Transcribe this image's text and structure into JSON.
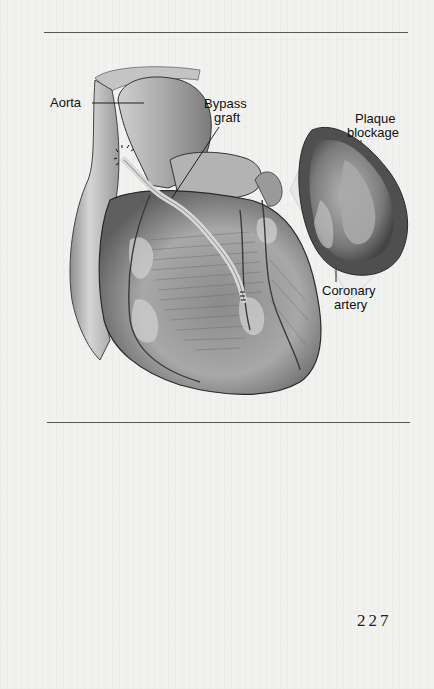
{
  "figure": {
    "labels": {
      "aorta": "Aorta",
      "bypass_graft_line1": "Bypass",
      "bypass_graft_line2": "graft",
      "plaque_blockage_line1": "Plaque",
      "plaque_blockage_line2": "blockage",
      "coronary_artery_line1": "Coronary",
      "coronary_artery_line2": "artery"
    },
    "illustration": "heart-with-bypass-graft-and-artery-cross-section"
  },
  "footer": {
    "page_number": "227"
  },
  "colors": {
    "page_background": "#f1f1ef",
    "rule": "#555555",
    "text": "#111111"
  }
}
